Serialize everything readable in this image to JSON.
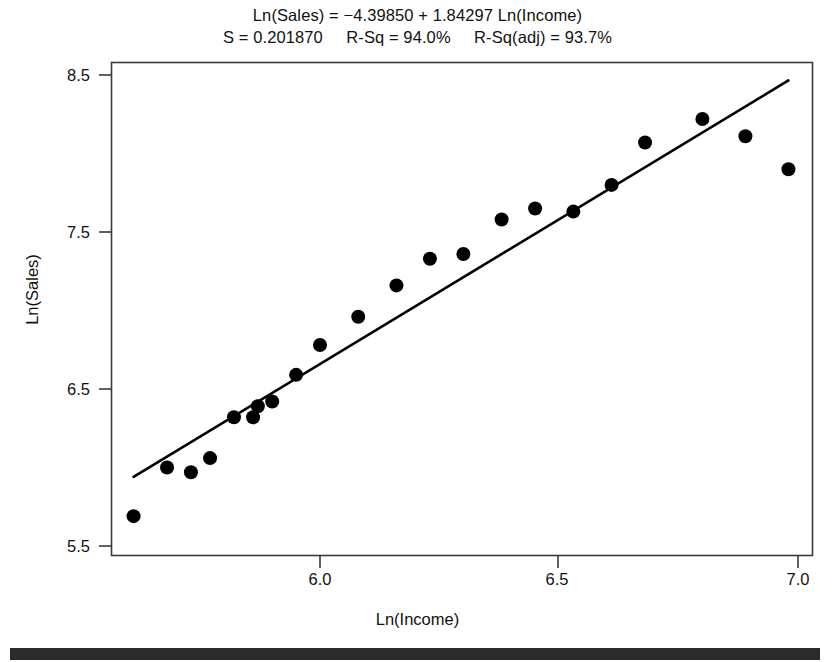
{
  "chart_data": {
    "type": "scatter",
    "title": "Ln(Sales) = −4.39850 + 1.84297 Ln(Income)",
    "subtitle": "S = 0.201870     R-Sq = 94.0%     R-Sq(adj) = 93.7%",
    "xlabel": "Ln(Income)",
    "ylabel": "Ln(Sales)",
    "xlim": [
      5.59,
      7.03
    ],
    "ylim": [
      5.44,
      8.61
    ],
    "xticks": [
      6.0,
      6.5,
      7.0
    ],
    "xtick_labels": [
      "6.0",
      "6.5",
      "7.0"
    ],
    "yticks": [
      5.5,
      6.5,
      7.5,
      8.5
    ],
    "ytick_labels": [
      "5.5",
      "6.5",
      "7.5",
      "8.5"
    ],
    "grid": false,
    "legend": null,
    "series": [
      {
        "name": "Observations",
        "marker": "filled-circle",
        "color": "#000000",
        "points": [
          {
            "x": 5.61,
            "y": 5.69
          },
          {
            "x": 5.68,
            "y": 6.0
          },
          {
            "x": 5.73,
            "y": 5.97
          },
          {
            "x": 5.77,
            "y": 6.06
          },
          {
            "x": 5.82,
            "y": 6.32
          },
          {
            "x": 5.86,
            "y": 6.32
          },
          {
            "x": 5.87,
            "y": 6.39
          },
          {
            "x": 5.9,
            "y": 6.42
          },
          {
            "x": 5.95,
            "y": 6.59
          },
          {
            "x": 6.0,
            "y": 6.78
          },
          {
            "x": 6.08,
            "y": 6.96
          },
          {
            "x": 6.16,
            "y": 7.16
          },
          {
            "x": 6.23,
            "y": 7.33
          },
          {
            "x": 6.3,
            "y": 7.36
          },
          {
            "x": 6.38,
            "y": 7.58
          },
          {
            "x": 6.45,
            "y": 7.65
          },
          {
            "x": 6.53,
            "y": 7.63
          },
          {
            "x": 6.61,
            "y": 7.8
          },
          {
            "x": 6.68,
            "y": 8.07
          },
          {
            "x": 6.8,
            "y": 8.22
          },
          {
            "x": 6.89,
            "y": 8.11
          },
          {
            "x": 6.98,
            "y": 7.9
          }
        ]
      }
    ],
    "fit_line": {
      "name": "Regression line",
      "equation": "Ln(Sales) = −4.39850 + 1.84297 Ln(Income)",
      "intercept": -4.3985,
      "slope": 1.84297,
      "x_start": 5.61,
      "x_end": 6.98,
      "color": "#000000"
    },
    "statistics": {
      "s": "0.201870",
      "r_sq": "94.0%",
      "r_sq_adj": "93.7%"
    }
  },
  "footer": {
    "bar_color": "#2b2b2b"
  }
}
